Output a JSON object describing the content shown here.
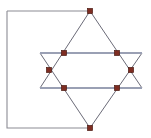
{
  "figure": {
    "type": "geometric-diagram",
    "canvas": {
      "width": 151,
      "height": 138,
      "background": "#ffffff"
    },
    "colors": {
      "frame_stroke": "#8c8c94",
      "hexagram_stroke": "#6b6b78",
      "horizontal_stroke": "#9aa0b4",
      "node_fill": "#7e2d22",
      "node_stroke": "#4a1a12"
    },
    "strokes": {
      "frame_width": 1.1,
      "hexagram_width": 1.0,
      "horizontal_width": 1.8
    },
    "frame_label": "open-rectangle-frame",
    "frame_points": "7,11 7,128 90,128",
    "frame_top_line": "7,11 90,11",
    "hexagram_label": "star-of-david",
    "triangle_down_points": "90,11 40,88 142,88",
    "triangle_up_points": "90,128 40,53 142,53",
    "horizontal_upper": {
      "x1": 40,
      "y1": 53,
      "x2": 142,
      "y2": 53
    },
    "horizontal_lower": {
      "x1": 40,
      "y1": 88,
      "x2": 142,
      "y2": 88
    },
    "node_size": 5,
    "nodes": [
      {
        "name": "node-top-apex",
        "x": 90,
        "y": 11
      },
      {
        "name": "node-bottom-apex",
        "x": 90,
        "y": 128
      },
      {
        "name": "node-upper-left",
        "x": 64,
        "y": 53
      },
      {
        "name": "node-upper-right",
        "x": 117,
        "y": 53
      },
      {
        "name": "node-lower-left",
        "x": 64,
        "y": 88
      },
      {
        "name": "node-lower-right",
        "x": 117,
        "y": 88
      },
      {
        "name": "node-left-crossing",
        "x": 49,
        "y": 70
      },
      {
        "name": "node-right-crossing",
        "x": 131,
        "y": 70
      }
    ]
  }
}
